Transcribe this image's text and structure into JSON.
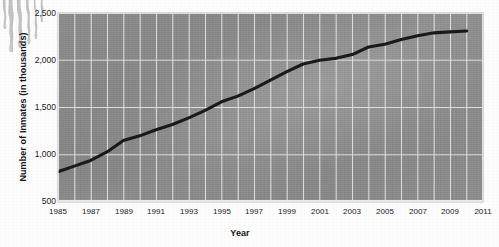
{
  "chart_data": {
    "type": "line",
    "title": "",
    "xlabel": "Year",
    "ylabel": "Number of Inmates (in thousands)",
    "xlim": [
      1985,
      2011
    ],
    "ylim": [
      500,
      2500
    ],
    "grid": true,
    "legend": null,
    "x_ticks": [
      "1985",
      "1987",
      "1989",
      "1991",
      "1993",
      "1995",
      "1997",
      "1999",
      "2001",
      "2003",
      "2005",
      "2007",
      "2009",
      "2011"
    ],
    "y_ticks": [
      "500",
      "1,000",
      "1,500",
      "2,000",
      "2,500"
    ],
    "x": [
      1985,
      1986,
      1987,
      1988,
      1989,
      1990,
      1991,
      1992,
      1993,
      1994,
      1995,
      1996,
      1997,
      1998,
      1999,
      2000,
      2001,
      2002,
      2003,
      2004,
      2005,
      2006,
      2007,
      2008,
      2009,
      2010
    ],
    "values": [
      820,
      880,
      940,
      1030,
      1150,
      1200,
      1265,
      1320,
      1390,
      1470,
      1560,
      1620,
      1700,
      1790,
      1880,
      1960,
      2000,
      2020,
      2060,
      2140,
      2170,
      2220,
      2260,
      2290,
      2300,
      2310
    ],
    "series": [
      {
        "name": "Number of Inmates",
        "color": "#1a1a1a",
        "values": [
          820,
          880,
          940,
          1030,
          1150,
          1200,
          1265,
          1320,
          1390,
          1470,
          1560,
          1620,
          1700,
          1790,
          1880,
          1960,
          2000,
          2020,
          2060,
          2140,
          2170,
          2220,
          2260,
          2290,
          2300,
          2310
        ]
      }
    ],
    "colors": {
      "line": "#1a1a1a",
      "plot_background": "#8d8d8d",
      "gridline": "#e8e8e8",
      "text": "#1b1b1b",
      "page_background": "#fcfcfc"
    }
  }
}
